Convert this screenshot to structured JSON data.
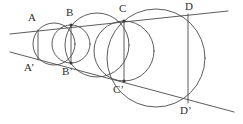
{
  "figure": {
    "stroke_color": "#4a4a4a",
    "label_color": "#2e2e2e",
    "background_color": "#ffffff",
    "width": 243,
    "height": 124
  },
  "labels": {
    "A": "A",
    "A_prime": "A’",
    "B": "B",
    "B_prime": "B’",
    "C": "C",
    "C_prime": "C’",
    "D": "D",
    "D_prime": "D’"
  },
  "points": {
    "A": {
      "name": "A",
      "x": 38,
      "y": 30,
      "label_x": 28,
      "label_y": 12
    },
    "A_prime": {
      "name": "A’",
      "x": 38,
      "y": 60,
      "label_x": 24,
      "label_y": 62
    },
    "B": {
      "name": "B",
      "x": 71,
      "y": 25,
      "label_x": 66,
      "label_y": 7
    },
    "B_prime": {
      "name": "B’",
      "x": 71,
      "y": 63,
      "label_x": 62,
      "label_y": 66
    },
    "C": {
      "name": "C",
      "x": 124,
      "y": 21,
      "label_x": 119,
      "label_y": 3
    },
    "C_prime": {
      "name": "C’",
      "x": 124,
      "y": 81,
      "label_x": 113,
      "label_y": 84
    },
    "D": {
      "name": "D",
      "x": 188,
      "y": 14,
      "label_x": 185,
      "label_y": 1
    },
    "D_prime": {
      "name": "D’",
      "x": 188,
      "y": 103,
      "label_x": 180,
      "label_y": 105
    }
  },
  "lines": {
    "upper": {
      "name": "upper-line",
      "x1": 10,
      "y1": 34,
      "x2": 228,
      "y2": 11
    },
    "lower": {
      "name": "lower-line",
      "x1": 10,
      "y1": 52,
      "x2": 234,
      "y2": 112
    }
  },
  "circles": [
    {
      "name": "circle-A-B",
      "cx": 54,
      "cy": 44,
      "r": 21
    },
    {
      "name": "circle-B-C",
      "cx": 97,
      "cy": 45,
      "r": 32
    },
    {
      "name": "circle-C-D",
      "cx": 156,
      "cy": 58,
      "r": 49
    },
    {
      "name": "circle-small-B",
      "cx": 71,
      "cy": 44,
      "r": 19
    },
    {
      "name": "circle-small-C",
      "cx": 124,
      "cy": 51,
      "r": 30
    }
  ],
  "chords": [
    {
      "name": "chord-AA",
      "x1": 38,
      "y1": 30,
      "x2": 38,
      "y2": 60
    },
    {
      "name": "chord-BB",
      "x1": 71,
      "y1": 25,
      "x2": 71,
      "y2": 63
    },
    {
      "name": "chord-CC",
      "x1": 124,
      "y1": 21,
      "x2": 124,
      "y2": 81
    },
    {
      "name": "chord-DD",
      "x1": 188,
      "y1": 14,
      "x2": 188,
      "y2": 103
    }
  ]
}
